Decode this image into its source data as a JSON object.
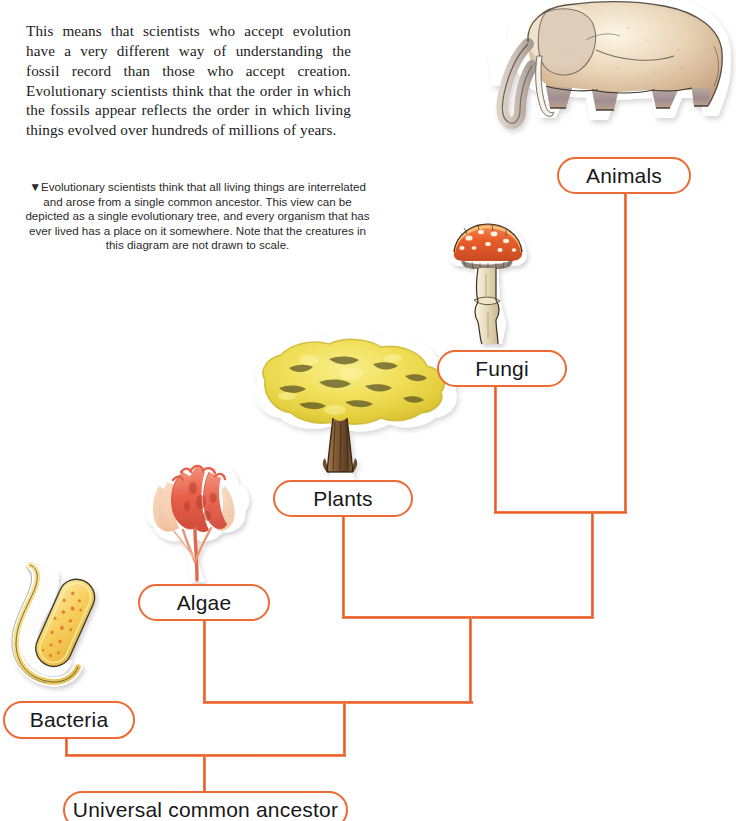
{
  "page": {
    "width": 736,
    "height": 821,
    "background": "#ffffff",
    "accent_color": "#ee6a34",
    "text_color": "#16181a"
  },
  "body_text": {
    "paragraph": "This means that scientists who accept evolution have a very different way of understanding the fossil record than those who accept creation. Evolutionary scientists think that the order in which the fossils appear reflects the order in which living things evolved over hundreds of millions of years."
  },
  "figure_caption": {
    "marker": "▼",
    "text": "Evolutionary scientists think that all living things are interrelated and arose from a single common ancestor. This view can be depicted as a single evolutionary tree, and every organism that has ever lived has a place on it somewhere. Note that the creatures in this diagram are not drawn to scale."
  },
  "diagram": {
    "type": "cladogram",
    "nodes": [
      {
        "id": "animals",
        "label": "Animals",
        "x": 557,
        "y": 157,
        "w": 134,
        "h": 37,
        "font_size": 21
      },
      {
        "id": "fungi",
        "label": "Fungi",
        "x": 437,
        "y": 350,
        "w": 130,
        "h": 37,
        "font_size": 21
      },
      {
        "id": "plants",
        "label": "Plants",
        "x": 273,
        "y": 480,
        "w": 140,
        "h": 37,
        "font_size": 21
      },
      {
        "id": "algae",
        "label": "Algae",
        "x": 138,
        "y": 584,
        "w": 132,
        "h": 37,
        "font_size": 21
      },
      {
        "id": "bacteria",
        "label": "Bacteria",
        "x": 3,
        "y": 701,
        "w": 132,
        "h": 38,
        "font_size": 21
      },
      {
        "id": "root",
        "label": "Universal common ancestor",
        "x": 63,
        "y": 791,
        "w": 285,
        "h": 38,
        "font_size": 21
      }
    ],
    "illustrations": [
      {
        "id": "elephant",
        "name": "elephant-illustration",
        "for_node": "animals",
        "x": 468,
        "y": -6,
        "w": 268,
        "h": 160
      },
      {
        "id": "mushroom",
        "name": "mushroom-illustration",
        "for_node": "fungi",
        "x": 436,
        "y": 216,
        "w": 100,
        "h": 132
      },
      {
        "id": "tree",
        "name": "tree-illustration",
        "for_node": "plants",
        "x": 243,
        "y": 330,
        "w": 224,
        "h": 150
      },
      {
        "id": "seaweed",
        "name": "algae-illustration",
        "for_node": "algae",
        "x": 139,
        "y": 458,
        "w": 117,
        "h": 126
      },
      {
        "id": "microbe",
        "name": "bacterium-illustration",
        "for_node": "bacteria",
        "x": 8,
        "y": 559,
        "w": 96,
        "h": 140
      }
    ],
    "edges": [
      {
        "from": "animals",
        "to": "junction-fungi-animals"
      },
      {
        "from": "fungi",
        "to": "junction-fungi-animals"
      },
      {
        "from": "plants",
        "to": "junction-plants"
      },
      {
        "from": "algae",
        "to": "junction-algae"
      },
      {
        "from": "bacteria",
        "to": "junction-bacteria"
      },
      {
        "from": "junction-bacteria",
        "to": "root"
      }
    ]
  }
}
